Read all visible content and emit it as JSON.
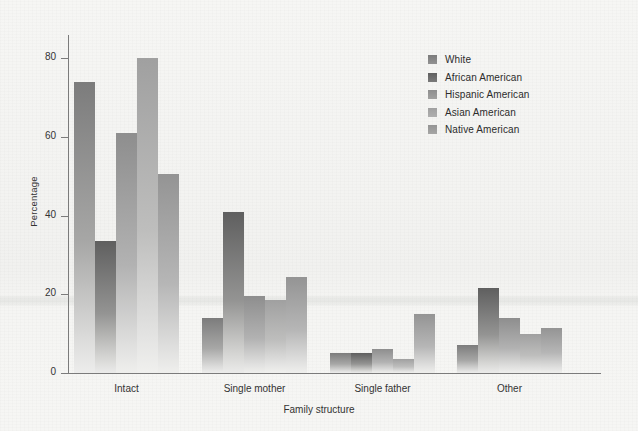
{
  "chart_data": {
    "type": "bar",
    "title": "",
    "xlabel": "Family structure",
    "ylabel": "Percentage",
    "categories": [
      "Intact",
      "Single mother",
      "Single father",
      "Other"
    ],
    "ylim": [
      0,
      85
    ],
    "yticks": [
      0,
      20,
      40,
      60,
      80
    ],
    "grid": false,
    "legend_position": "top-right",
    "series": [
      {
        "name": "White",
        "color": "#7c7c7c",
        "values": [
          74,
          14,
          5,
          7
        ]
      },
      {
        "name": "African American",
        "color": "#5f5f5f",
        "values": [
          33.5,
          41,
          5,
          21.5
        ]
      },
      {
        "name": "Hispanic American",
        "color": "#8e8e8e",
        "values": [
          61,
          19.5,
          6,
          14
        ]
      },
      {
        "name": "Asian American",
        "color": "#a0a0a0",
        "values": [
          80,
          18.5,
          3.5,
          10
        ]
      },
      {
        "name": "Native American",
        "color": "#949494",
        "values": [
          50.5,
          24.5,
          15,
          11.5
        ]
      }
    ]
  },
  "axis": {
    "y_tick_labels": [
      "0",
      "20",
      "40",
      "60",
      "80"
    ],
    "y_label": "Percentage",
    "x_label": "Family structure",
    "x_tick_labels": [
      "Intact",
      "Single mother",
      "Single father",
      "Other"
    ]
  },
  "legend": {
    "items": [
      {
        "label": "White"
      },
      {
        "label": "African American"
      },
      {
        "label": "Hispanic American"
      },
      {
        "label": "Asian American"
      },
      {
        "label": "Native American"
      }
    ]
  }
}
